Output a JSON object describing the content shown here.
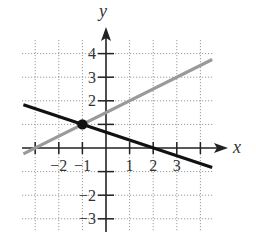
{
  "chart_data": {
    "type": "line",
    "title": "",
    "xlabel": "x",
    "ylabel": "y",
    "xlim": [
      -3.5,
      4.5
    ],
    "ylim": [
      -3.5,
      4.5
    ],
    "grid": true,
    "grid_style": "dotted",
    "x_ticks": [
      -3,
      -2,
      -1,
      0,
      1,
      2,
      3,
      4
    ],
    "y_ticks": [
      -3,
      -2,
      -1,
      0,
      1,
      2,
      3,
      4
    ],
    "x_tick_labels": [
      {
        "value": -2,
        "label": "−2"
      },
      {
        "value": -1,
        "label": "−1"
      },
      {
        "value": 1,
        "label": "1"
      },
      {
        "value": 2,
        "label": "2"
      },
      {
        "value": 3,
        "label": "3"
      }
    ],
    "y_tick_labels": [
      {
        "value": 4,
        "label": "4"
      },
      {
        "value": 3,
        "label": "3"
      },
      {
        "value": 2,
        "label": "2"
      },
      {
        "value": -2,
        "label": "−2"
      },
      {
        "value": -3,
        "label": "−3"
      }
    ],
    "series": [
      {
        "name": "gray line",
        "equation": "y = x/2 + 3/2",
        "color": "#9a9a9a",
        "x": [
          -3.5,
          4.5
        ],
        "y": [
          -0.25,
          3.75
        ]
      },
      {
        "name": "black line",
        "equation": "y = -x/3 + 2/3",
        "color": "#111111",
        "x": [
          -3.5,
          4.5
        ],
        "y": [
          1.83,
          -0.83
        ]
      }
    ],
    "points": [
      {
        "name": "intersection",
        "x": -1,
        "y": 1,
        "color": "#111111"
      }
    ],
    "legend": null
  },
  "layout": {
    "origin_px": [
      106,
      148
    ],
    "unit_px": 23.6,
    "grid_left_px": 22,
    "grid_right_px": 213,
    "grid_top_px": 40,
    "grid_bottom_px": 232
  },
  "labels": {
    "x_axis": "x",
    "y_axis": "y"
  }
}
